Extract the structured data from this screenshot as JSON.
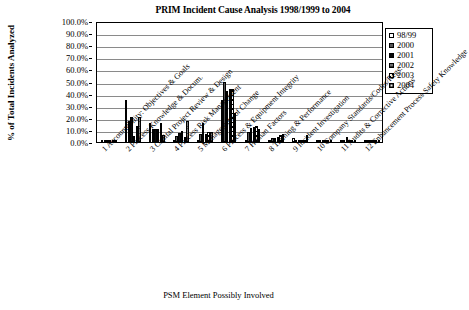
{
  "chart_data": {
    "type": "bar",
    "title": "PRIM Incident Cause Analysis 1998/1999 to 2004",
    "xlabel": "PSM Element Possibly Involved",
    "ylabel": "% of Total Incidents Analyzed",
    "ylim": [
      0,
      100
    ],
    "ytick_labels": [
      "100.0%",
      "90.0%",
      "80.0%",
      "70.0%",
      "60.0%",
      "50.0%",
      "40.0%",
      "30.0%",
      "20.0%",
      "10.0%",
      "0.0%"
    ],
    "ytick_values": [
      100,
      90,
      80,
      70,
      60,
      50,
      40,
      30,
      20,
      10,
      0
    ],
    "grid": true,
    "legend_position": "upper-right",
    "categories": [
      "1 Accountability: Objectives & Goals",
      "2 Process Knowledge & Docum.",
      "3 Capital Project Review & Design",
      "4 Process Risk Management",
      "5 Management of Change",
      "6 Process & Equipment Integrity",
      "7 Human Factors",
      "8 Training & Performance",
      "9 Incident Investigation",
      "10 Company Standards/Codes/Regs.",
      "11 Audits & Corrective Actions",
      "12 Enhancement Process Safety Knowledge"
    ],
    "series": [
      {
        "name": "98/99",
        "values": [
          1.0,
          35.0,
          16.0,
          1.5,
          0.8,
          35.0,
          1.5,
          0.5,
          3.5,
          0.5,
          0.5,
          0.3
        ]
      },
      {
        "name": "2000",
        "values": [
          0.6,
          17.5,
          11.0,
          5.0,
          6.5,
          50.0,
          8.0,
          3.5,
          1.5,
          0.8,
          1.8,
          0.2
        ]
      },
      {
        "name": "2001",
        "values": [
          0.8,
          21.0,
          10.5,
          7.5,
          15.5,
          42.0,
          11.5,
          3.5,
          0.5,
          1.2,
          4.5,
          0.2
        ]
      },
      {
        "name": "2002",
        "values": [
          1.8,
          5.0,
          11.0,
          9.0,
          6.5,
          44.0,
          12.0,
          4.5,
          0.5,
          1.5,
          0.6,
          0.8
        ]
      },
      {
        "name": "2003",
        "values": [
          1.8,
          13.0,
          16.0,
          4.5,
          8.0,
          44.0,
          13.5,
          5.5,
          0.5,
          0.8,
          0.5,
          0.2
        ]
      },
      {
        "name": "2004",
        "values": [
          0.4,
          21.0,
          6.0,
          17.0,
          8.0,
          24.0,
          10.5,
          6.5,
          5.5,
          0.5,
          0.5,
          1.0
        ]
      }
    ],
    "series_styles": [
      "white-open",
      "dark-gray-solid",
      "black-solid",
      "gray-horizontal-lines",
      "diagonal-hatch",
      "light-dotted-grid"
    ]
  },
  "legend": {
    "items": [
      {
        "label": "98/99"
      },
      {
        "label": "2000"
      },
      {
        "label": "2001"
      },
      {
        "label": "2002"
      },
      {
        "label": "2003"
      },
      {
        "label": "2004"
      }
    ]
  },
  "colors": {
    "axis": "#000000",
    "gridline": "#8a8a8a",
    "background": "#ffffff"
  }
}
